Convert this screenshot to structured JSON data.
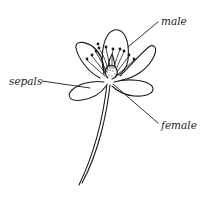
{
  "diagram": {
    "type": "labeled-illustration",
    "stroke_color": "#1a1a1a",
    "background": "#ffffff",
    "labels": [
      {
        "id": "male",
        "text": "male"
      },
      {
        "id": "sepals",
        "text": "sepals"
      },
      {
        "id": "female",
        "text": "female"
      }
    ]
  }
}
